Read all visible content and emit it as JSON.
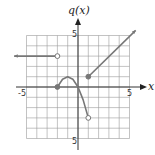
{
  "chart_data": {
    "type": "line",
    "title": "",
    "xlabel": "x",
    "ylabel": "q(x)",
    "xlim": [
      -5,
      5
    ],
    "ylim": [
      -5,
      5
    ],
    "grid": true,
    "tick_labels": {
      "x": [
        "-5",
        "5"
      ],
      "y": [
        "5",
        "-5"
      ]
    },
    "pieces": [
      {
        "name": "left-ray",
        "kind": "ray",
        "points": [
          [
            -6.2,
            3
          ],
          [
            -2,
            3
          ]
        ],
        "start": "arrow",
        "end": "open"
      },
      {
        "name": "parabola",
        "kind": "curve",
        "points": [
          [
            -2,
            0
          ],
          [
            -1.5,
            0.75
          ],
          [
            -1,
            1
          ],
          [
            -0.5,
            0.75
          ],
          [
            0,
            0
          ],
          [
            0.5,
            -1.25
          ],
          [
            1,
            -3
          ]
        ],
        "start": "closed",
        "end": "open"
      },
      {
        "name": "right-ray",
        "kind": "ray",
        "points": [
          [
            1,
            1
          ],
          [
            5.6,
            5.5
          ]
        ],
        "start": "closed",
        "end": "arrow"
      }
    ],
    "line_color": "#777777"
  },
  "labels": {
    "y_axis_title": "q(x)",
    "x_axis_title": "x",
    "x_min_tick": "-5",
    "x_max_tick": "5",
    "y_max_tick": "5",
    "y_min_tick": "5"
  }
}
